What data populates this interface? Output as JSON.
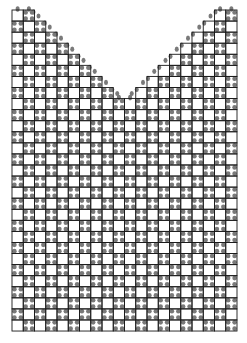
{
  "diagram": {
    "type": "lace-stitch-chart",
    "shape": "v-neck",
    "grid": {
      "origin_x": 12,
      "origin_y": 10,
      "cell": 11.25,
      "cell_h": 11.07,
      "cols": 20,
      "rows": 29,
      "line_color": "#1a1a1a",
      "dot_color": "#7a7a7a"
    },
    "neckline": {
      "top_shoulder_width_cells": 2,
      "v_depth_rows": 8,
      "step_per_row_cells": 1
    }
  }
}
